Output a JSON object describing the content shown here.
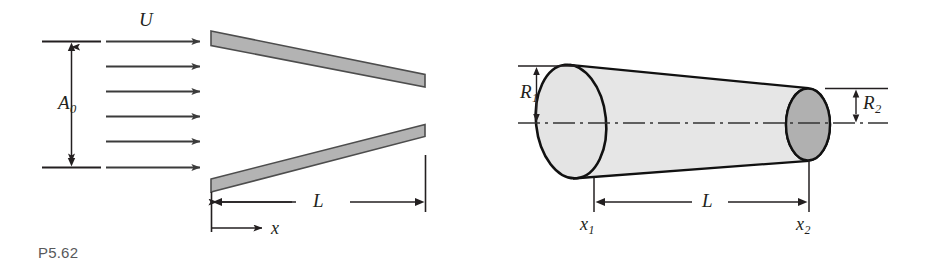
{
  "sheet": {
    "background": "#ffffff",
    "ink": "#231f20",
    "caption_color": "#58595b",
    "width": 940,
    "height": 280
  },
  "figures": [
    {
      "id": "P5.62",
      "caption": "P5.62",
      "description": "Uniform stream U entering the gap between two diverging flat plates over length L",
      "labels": {
        "inlet_velocity": "U",
        "inlet_area": "A",
        "inlet_area_sub": "0",
        "length": "L",
        "axis": "x"
      },
      "colors": {
        "plate_fill": "#b3b3b3",
        "plate_edge": "#4d4d4d"
      },
      "flow_arrows": 6
    },
    {
      "id": "P5.63",
      "caption": "P5.63",
      "description": "Tapered conical duct of length L from station x1 with radius R1 to station x2 with radius R2",
      "labels": {
        "radius_inlet": "R",
        "radius_inlet_sub": "1",
        "radius_outlet": "R",
        "radius_outlet_sub": "2",
        "length": "L",
        "station_inlet": "x",
        "station_inlet_sub": "1",
        "station_outlet": "x",
        "station_outlet_sub": "2"
      },
      "colors": {
        "body_fill": "#e6e6e6",
        "inlet_face_fill": "#e0e0e0",
        "outlet_face_fill": "#b0b0b0",
        "edge": "#111111",
        "centerline": "#333333"
      }
    }
  ]
}
